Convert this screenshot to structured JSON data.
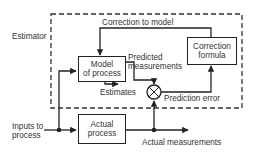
{
  "diagram": {
    "estimator_label": "Estimator",
    "model_box": {
      "line1": "Model",
      "line2": "of process"
    },
    "correction_box": {
      "line1": "Correction",
      "line2": "formula"
    },
    "actual_box": {
      "line1": "Actual",
      "line2": "process"
    },
    "correction_to_model": "Correction to model",
    "predicted_measurements": {
      "line1": "Predicted",
      "line2": "measurements"
    },
    "estimates": "Estimates",
    "prediction_error": "Prediction error",
    "inputs": {
      "line1": "Inputs to",
      "line2": "process"
    },
    "actual_measurements": "Actual measurements",
    "summing_junction_signs": [
      "+",
      "-"
    ],
    "line_color": "#222222",
    "text_color": "#333333"
  }
}
